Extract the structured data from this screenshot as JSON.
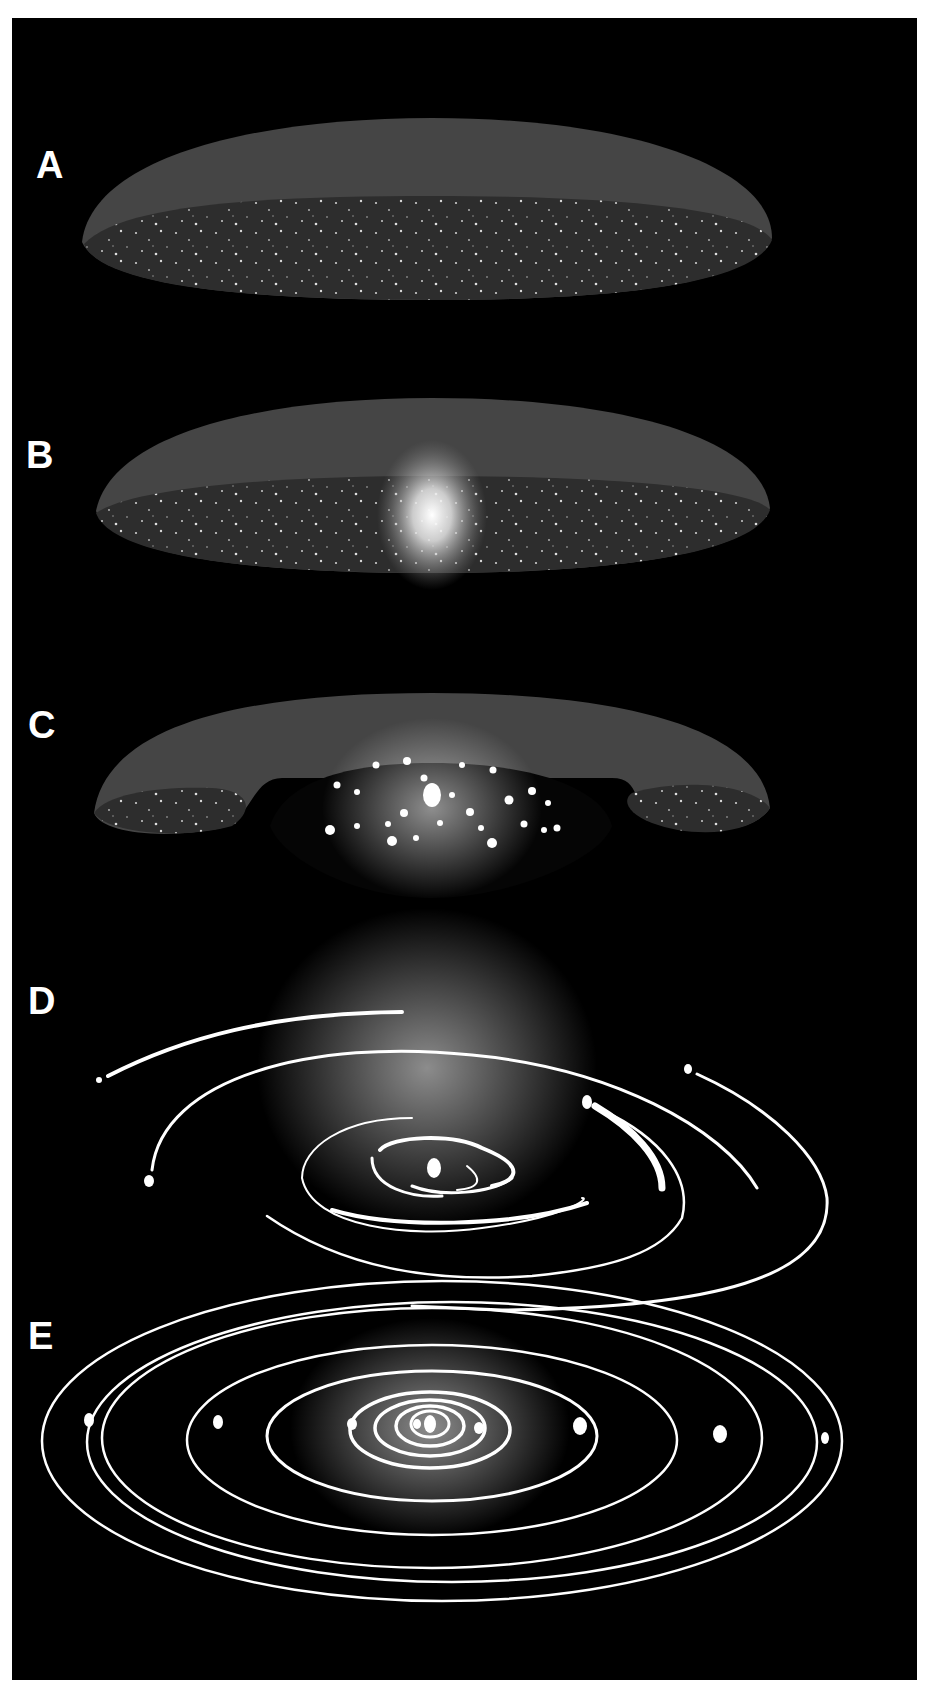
{
  "figure": {
    "background_color": "#000000",
    "stages": [
      {
        "label": "A",
        "description": "Flattened cloud / disk of dust and gas"
      },
      {
        "label": "B",
        "description": "Disk with bright central condensation"
      },
      {
        "label": "C",
        "description": "Central star with clumps forming; torus-shaped outer disk"
      },
      {
        "label": "D",
        "description": "Partial orbital arcs (planetesimals sweeping orbits)"
      },
      {
        "label": "E",
        "description": "Complete planetary orbits around central star"
      }
    ]
  }
}
